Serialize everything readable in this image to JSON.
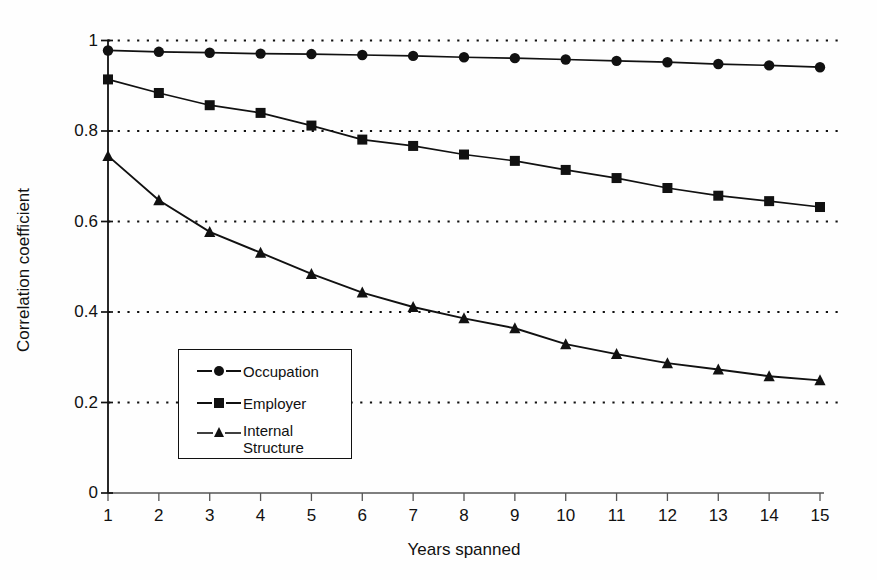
{
  "chart_data": {
    "type": "line",
    "title": "",
    "xlabel": "Years spanned",
    "ylabel": "Correlation coefficient",
    "x": [
      1,
      2,
      3,
      4,
      5,
      6,
      7,
      8,
      9,
      10,
      11,
      12,
      13,
      14,
      15
    ],
    "xtick_labels": [
      "1",
      "2",
      "3",
      "4",
      "5",
      "6",
      "7",
      "8",
      "9",
      "10",
      "11",
      "12",
      "13",
      "14",
      "15"
    ],
    "ytick_labels": [
      "0",
      "0.2",
      "0.4",
      "0.6",
      "0.8",
      "1"
    ],
    "yticks": [
      0,
      0.2,
      0.4,
      0.6,
      0.8,
      1
    ],
    "xlim": [
      1,
      15
    ],
    "ylim": [
      0,
      1
    ],
    "grid": "horizontal-dotted",
    "legend_position": "lower-left-inside",
    "series": [
      {
        "name": "Occupation",
        "marker": "circle",
        "color": "#111111",
        "values": [
          0.978,
          0.975,
          0.973,
          0.971,
          0.97,
          0.968,
          0.966,
          0.963,
          0.961,
          0.958,
          0.955,
          0.952,
          0.948,
          0.945,
          0.941
        ]
      },
      {
        "name": "Employer",
        "marker": "square",
        "color": "#111111",
        "values": [
          0.914,
          0.884,
          0.857,
          0.84,
          0.812,
          0.781,
          0.767,
          0.748,
          0.734,
          0.714,
          0.696,
          0.674,
          0.657,
          0.645,
          0.632
        ]
      },
      {
        "name": "Internal\nStructure",
        "marker": "triangle",
        "color": "#111111",
        "values": [
          0.745,
          0.647,
          0.577,
          0.531,
          0.484,
          0.443,
          0.411,
          0.386,
          0.364,
          0.329,
          0.307,
          0.287,
          0.273,
          0.258,
          0.249
        ]
      }
    ]
  },
  "axis": {
    "y_title": "Correlation coefficient",
    "x_title": "Years spanned",
    "y_labels": [
      "1",
      "0.8",
      "0.6",
      "0.4",
      "0.2",
      "0"
    ],
    "x_labels": [
      "1",
      "2",
      "3",
      "4",
      "5",
      "6",
      "7",
      "8",
      "9",
      "10",
      "11",
      "12",
      "13",
      "14",
      "15"
    ]
  },
  "legend": {
    "items": [
      {
        "label": "Occupation",
        "marker": "circle-marker"
      },
      {
        "label": "Employer",
        "marker": "square-marker"
      },
      {
        "label": "Internal\nStructure",
        "marker": "triangle-marker"
      }
    ]
  },
  "colors": {
    "ink": "#111111",
    "background": "#ffffff"
  }
}
